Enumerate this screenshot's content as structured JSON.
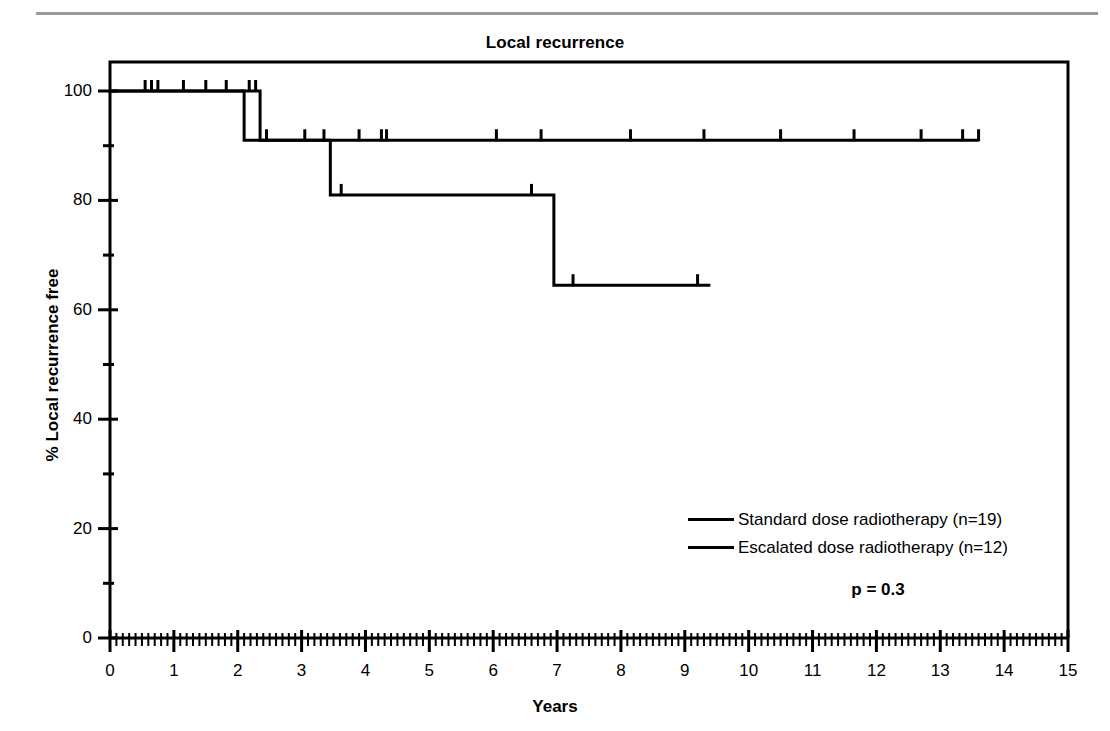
{
  "chart_data": {
    "type": "line",
    "subtype": "kaplan-meier-step",
    "title": "Local recurrence",
    "xlabel": "Years",
    "ylabel": "% Local recurrence free",
    "xlim": [
      0,
      15
    ],
    "ylim": [
      0,
      100
    ],
    "xticks": [
      0,
      1,
      2,
      3,
      4,
      5,
      6,
      7,
      8,
      9,
      10,
      11,
      12,
      13,
      14,
      15
    ],
    "xtick_labels": [
      "0",
      "1",
      "2",
      "3",
      "4",
      "5",
      "6",
      "7",
      "8",
      "9",
      "10",
      "11",
      "12",
      "13",
      "14",
      "15"
    ],
    "yticks": [
      0,
      20,
      40,
      60,
      80,
      100
    ],
    "ytick_labels": [
      "0",
      "20",
      "40",
      "60",
      "80",
      "100"
    ],
    "y_minor_ticks": [
      10,
      30,
      50,
      70,
      90
    ],
    "x_minor_tick_interval": 0.1,
    "grid": false,
    "legend_position": "center-right",
    "annotations": [
      {
        "name": "p-value",
        "text": "p = 0.3",
        "x": 9.6,
        "y": 10
      }
    ],
    "series": [
      {
        "name": "Standard dose radiotherapy (n=19)",
        "n": 19,
        "color": "#000000",
        "steps": [
          {
            "x": 0.0,
            "y": 100
          },
          {
            "x": 2.35,
            "y": 100
          },
          {
            "x": 2.35,
            "y": 91
          },
          {
            "x": 3.45,
            "y": 91
          },
          {
            "x": 3.45,
            "y": 81
          },
          {
            "x": 6.95,
            "y": 81
          },
          {
            "x": 6.95,
            "y": 64.5
          },
          {
            "x": 9.4,
            "y": 64.5
          }
        ],
        "censored": [
          {
            "x": 0.55,
            "y": 100
          },
          {
            "x": 0.65,
            "y": 100
          },
          {
            "x": 0.75,
            "y": 100
          },
          {
            "x": 1.15,
            "y": 100
          },
          {
            "x": 1.5,
            "y": 100
          },
          {
            "x": 1.82,
            "y": 100
          },
          {
            "x": 2.18,
            "y": 100
          },
          {
            "x": 2.28,
            "y": 100
          },
          {
            "x": 3.05,
            "y": 91
          },
          {
            "x": 3.35,
            "y": 91
          },
          {
            "x": 3.62,
            "y": 81
          },
          {
            "x": 6.6,
            "y": 81
          },
          {
            "x": 7.25,
            "y": 64.5
          },
          {
            "x": 9.2,
            "y": 64.5
          }
        ]
      },
      {
        "name": "Escalated dose radiotherapy (n=12)",
        "n": 12,
        "color": "#000000",
        "steps": [
          {
            "x": 0.0,
            "y": 100
          },
          {
            "x": 2.1,
            "y": 100
          },
          {
            "x": 2.1,
            "y": 91
          },
          {
            "x": 13.6,
            "y": 91
          }
        ],
        "censored": [
          {
            "x": 2.45,
            "y": 91
          },
          {
            "x": 3.9,
            "y": 91
          },
          {
            "x": 4.25,
            "y": 91
          },
          {
            "x": 4.33,
            "y": 91
          },
          {
            "x": 6.05,
            "y": 91
          },
          {
            "x": 6.75,
            "y": 91
          },
          {
            "x": 8.15,
            "y": 91
          },
          {
            "x": 9.3,
            "y": 91
          },
          {
            "x": 10.5,
            "y": 91
          },
          {
            "x": 11.65,
            "y": 91
          },
          {
            "x": 12.7,
            "y": 91
          },
          {
            "x": 13.35,
            "y": 91
          },
          {
            "x": 13.6,
            "y": 91
          }
        ]
      }
    ]
  },
  "legend": {
    "entries": [
      {
        "label": "Standard dose radiotherapy (n=19)"
      },
      {
        "label": "Escalated dose radiotherapy (n=12)"
      }
    ]
  },
  "pvalue": {
    "text": "p = 0.3"
  }
}
